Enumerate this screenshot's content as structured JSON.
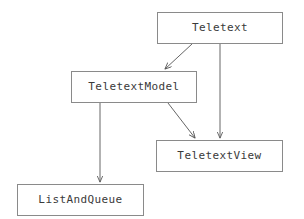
{
  "diagram": {
    "type": "class-diagram",
    "background_color": "#ffffff",
    "box_border_color": "#8a8a8a",
    "box_fill_color": "#ffffff",
    "text_color": "#3a3a3a",
    "arrow_color": "#555555",
    "nodes": [
      {
        "id": "teletext",
        "label": "Teletext",
        "x": 157,
        "y": 12,
        "width": 126,
        "height": 32
      },
      {
        "id": "teletext-model",
        "label": "TeletextModel",
        "x": 71,
        "y": 71,
        "width": 126,
        "height": 32
      },
      {
        "id": "teletext-view",
        "label": "TeletextView",
        "x": 156,
        "y": 140,
        "width": 127,
        "height": 32
      },
      {
        "id": "list-and-queue",
        "label": "ListAndQueue",
        "x": 17,
        "y": 184,
        "width": 127,
        "height": 32
      }
    ],
    "edges": [
      {
        "id": "teletext-to-teletextmodel",
        "from": "teletext",
        "to": "teletext-model",
        "x1": 192,
        "y1": 44,
        "x2": 165,
        "y2": 70,
        "style": "solid-arrow"
      },
      {
        "id": "teletext-to-teletextview",
        "from": "teletext",
        "to": "teletext-view",
        "x1": 220,
        "y1": 44,
        "x2": 220,
        "y2": 139,
        "style": "solid-arrow"
      },
      {
        "id": "teletextmodel-to-teletextview",
        "from": "teletext-model",
        "to": "teletext-view",
        "x1": 168,
        "y1": 103,
        "x2": 196,
        "y2": 139,
        "style": "solid-arrow"
      },
      {
        "id": "teletextmodel-to-listandqueue",
        "from": "teletext-model",
        "to": "list-and-queue",
        "x1": 100,
        "y1": 103,
        "x2": 100,
        "y2": 183,
        "style": "solid-arrow"
      }
    ]
  }
}
